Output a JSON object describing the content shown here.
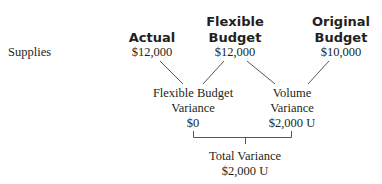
{
  "row_label": "Supplies",
  "columns": {
    "actual": {
      "header": [
        "Actual"
      ],
      "value": "$12,000"
    },
    "flexible_budget": {
      "header": [
        "Flexible",
        "Budget"
      ],
      "value": "$12,000"
    },
    "original_budget": {
      "header": [
        "Original",
        "Budget"
      ],
      "value": "$10,000"
    }
  },
  "variances": {
    "flexible_budget_variance": {
      "label": [
        "Flexible Budget",
        "Variance"
      ],
      "value": "$0"
    },
    "volume_variance": {
      "label": [
        "Volume",
        "Variance"
      ],
      "value": "$2,000 U"
    },
    "total_variance": {
      "label": "Total Variance",
      "value": "$2,000 U"
    }
  },
  "colors": {
    "text": "#231f20",
    "lines": "#555555"
  }
}
